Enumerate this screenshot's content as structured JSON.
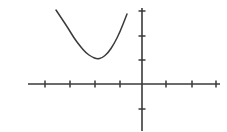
{
  "figure": {
    "name": "parabola-on-coordinate-plane",
    "background_color": "#ffffff",
    "stroke_color": "#3a3a3a",
    "width": 227,
    "height": 132
  },
  "chart_data": {
    "type": "line",
    "title": "",
    "xlabel": "",
    "ylabel": "",
    "grid": false,
    "legend": null,
    "axes": {
      "origin_px": {
        "x": 142,
        "y": 84
      },
      "tick_spacing_px": {
        "x": 25,
        "y": 24
      },
      "x_axis": {
        "start_px": {
          "x": 28,
          "y": 84
        },
        "end_px": {
          "x": 220,
          "y": 84
        },
        "tick_positions_px": [
          45,
          70,
          95,
          120,
          166,
          192,
          216
        ],
        "tick_values": [
          -4,
          -3,
          -2,
          -1,
          1,
          2,
          3
        ],
        "tick_length_px": 7,
        "arrowheads": false
      },
      "y_axis": {
        "start_px": {
          "x": 142,
          "y": 8
        },
        "end_px": {
          "x": 142,
          "y": 131
        },
        "tick_positions_px": [
          11,
          36,
          60,
          109
        ],
        "tick_values": [
          3,
          2,
          1,
          -1
        ],
        "tick_length_px": 7,
        "arrowheads": false
      },
      "xlim_units": [
        -4.6,
        3.1
      ],
      "ylim_units": [
        -2.0,
        3.2
      ]
    },
    "curve": {
      "name": "parabola",
      "vertex_px": {
        "x": 97,
        "y": 59
      },
      "left_endpoint_px": {
        "x": 56,
        "y": 10
      },
      "right_endpoint_px": {
        "x": 127,
        "y": 14
      },
      "vertex_units": {
        "x": -1.8,
        "y": 1.04
      },
      "left_endpoint_units": {
        "x": -3.44,
        "y": 3.08
      },
      "right_endpoint_units": {
        "x": -0.6,
        "y": 2.92
      },
      "opens": "up",
      "x_px": [
        56,
        62,
        68,
        74,
        80,
        86,
        92,
        97,
        102,
        108,
        114,
        120,
        127
      ],
      "y_px": [
        10,
        19,
        28,
        38,
        46,
        53,
        57,
        59,
        58,
        53,
        44,
        32,
        14
      ]
    }
  }
}
